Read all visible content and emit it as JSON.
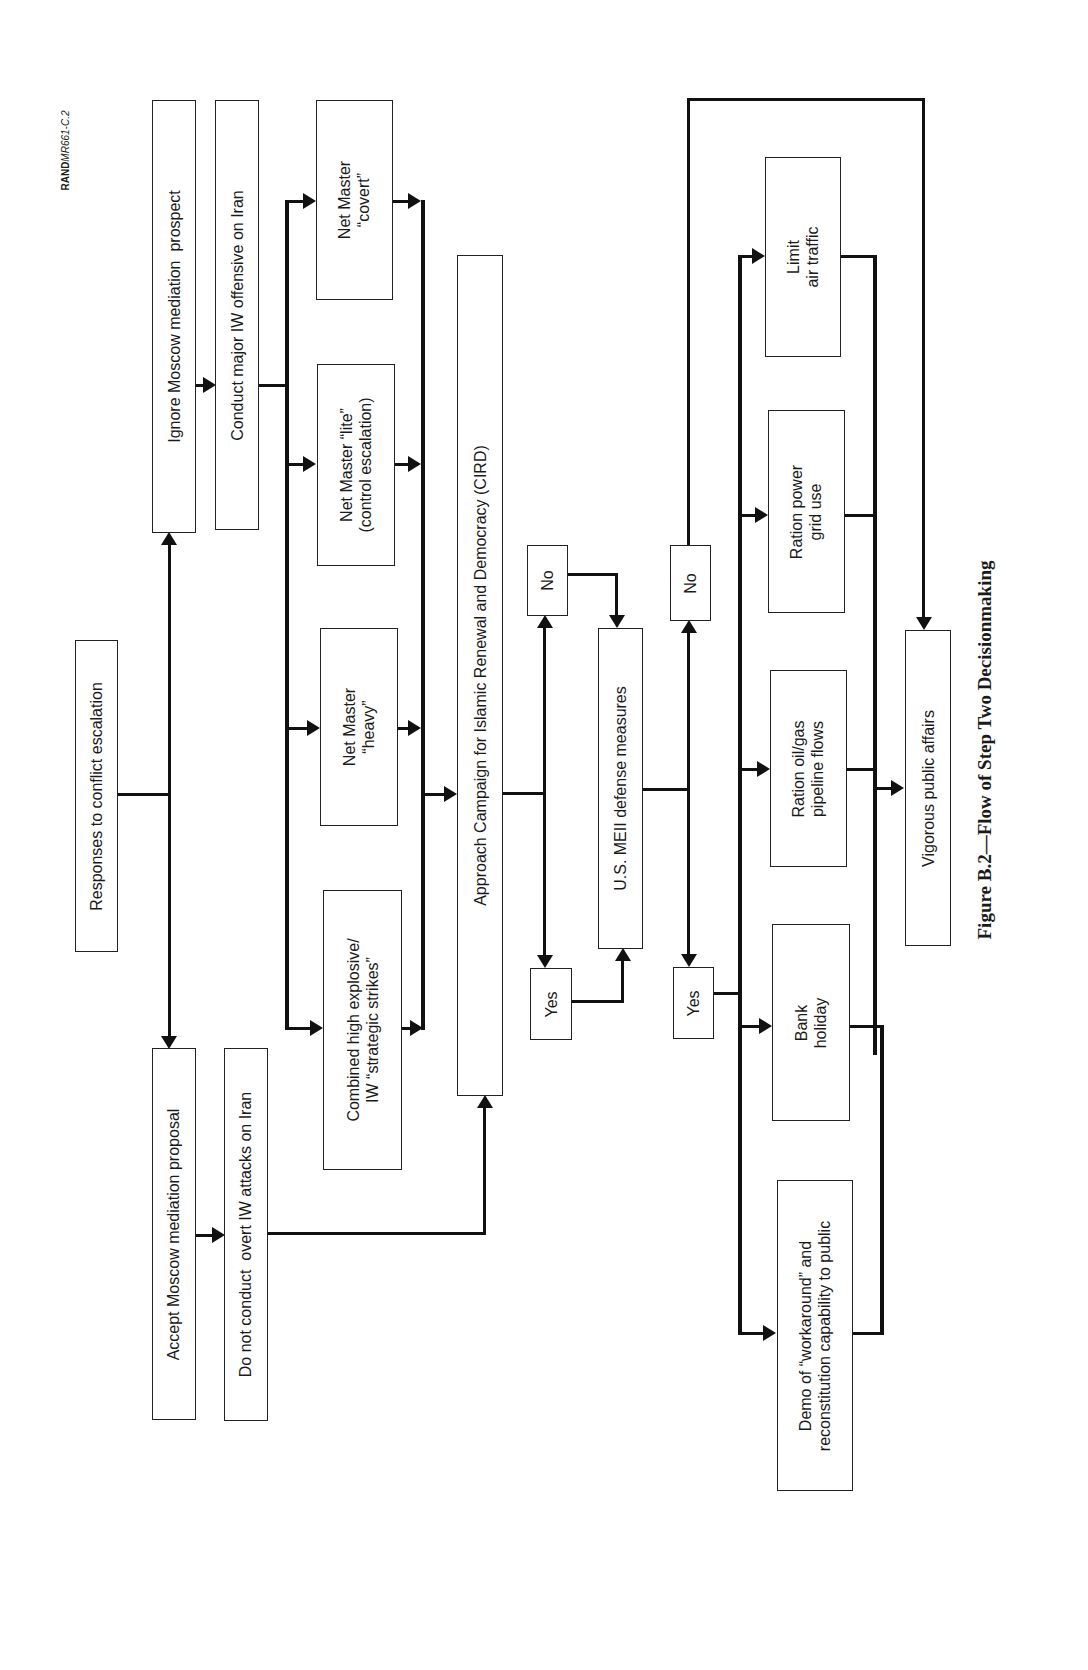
{
  "figure": {
    "id_label_prefix": "RAND",
    "id_label_suffix": "MR661-C.2",
    "caption": "Figure B.2—Flow of Step Two Decisionmaking"
  },
  "nodes": {
    "responses": "Responses to conflict escalation",
    "ignore_moscow": "Ignore Moscow mediation  prospect",
    "accept_moscow": "Accept Moscow mediation proposal",
    "conduct_major": "Conduct major IW offensive on Iran",
    "do_not_conduct": "Do not conduct  overt IW attacks on Iran",
    "net_master_covert": "Net Master\n“covert”",
    "net_master_lite": "Net Master “lite”\n(control escalation)",
    "net_master_heavy": "Net Master\n“heavy”",
    "combined_strikes": "Combined high explosive/\nIW “strategic strikes”",
    "approach_cird": "Approach Campaign for Islamic Renewal and Democracy (CIRD)",
    "no_1": "No",
    "yes_1": "Yes",
    "us_meii": "U.S. MEII defense measures",
    "no_2": "No",
    "yes_2": "Yes",
    "limit_air": "Limit\nair traffic",
    "ration_power": "Ration power\ngrid use",
    "ration_oil": "Ration oil/gas\npipeline flows",
    "bank_holiday": "Bank\nholiday",
    "demo_workaround": "Demo of “workaround” and\nreconstitution capability to public",
    "vigorous_public": "Vigorous public affairs"
  },
  "colors": {
    "line": "#111111",
    "box_border": "#222222",
    "background": "#ffffff"
  }
}
